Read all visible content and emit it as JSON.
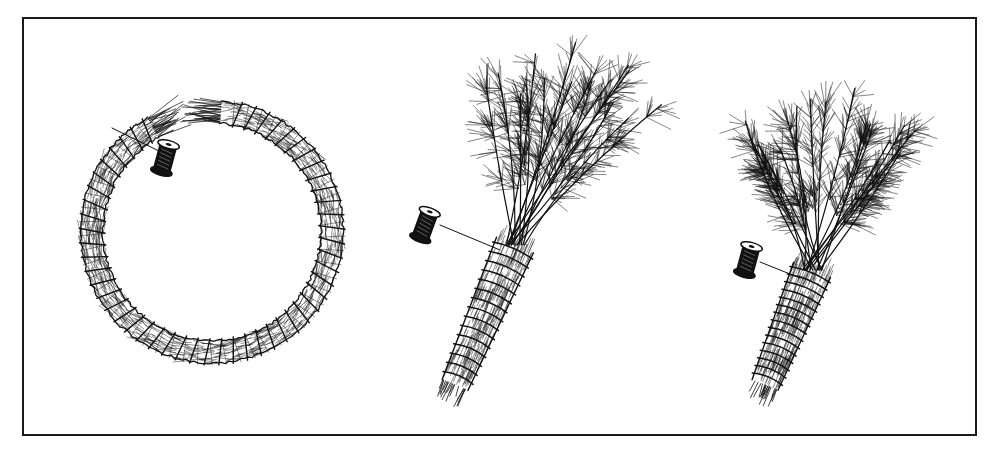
{
  "illustration": {
    "style": "black-and-white pen-and-ink line drawing",
    "ink_color": "#111111",
    "background_color": "#ffffff",
    "frame": {
      "x": 23,
      "y": 18,
      "width": 951,
      "height": 415
    },
    "panels": [
      {
        "id": "wreath-ring",
        "description": "Bundle of pine needles bent into an open circle and bound with spiral thread wraps; thread leads to a spool",
        "center": [
          212,
          232
        ],
        "radius": 120,
        "spool": {
          "x": 165,
          "y": 158
        }
      },
      {
        "id": "pine-bunch-1",
        "description": "Pine branch tips gathered and wrapped into a tapered handle with thread from a spool",
        "spool": {
          "x": 425,
          "y": 225
        }
      },
      {
        "id": "pine-bunch-2",
        "description": "Bushier pine bunch with wrapped stem and thread spool",
        "spool": {
          "x": 748,
          "y": 260
        }
      }
    ]
  }
}
